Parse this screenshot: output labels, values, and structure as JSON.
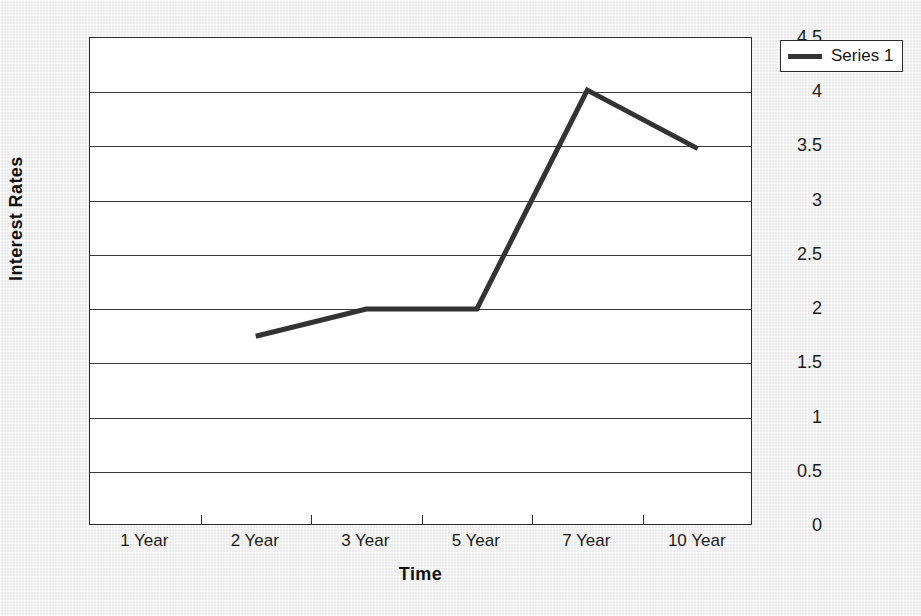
{
  "chart_data": {
    "type": "line",
    "title": "",
    "xlabel": "Time",
    "ylabel": "Interest Rates",
    "categories": [
      "1 Year",
      "2 Year",
      "3 Year",
      "5 Year",
      "7 Year",
      "10 Year"
    ],
    "series": [
      {
        "name": "Series 1",
        "values": [
          null,
          1.75,
          2.0,
          2.0,
          4.02,
          3.48
        ],
        "color": "#333333"
      }
    ],
    "ylim": [
      0,
      4.5
    ],
    "ytick_step": 0.5,
    "yticks": [
      "0",
      "0.5",
      "1",
      "1.5",
      "2",
      "2.5",
      "3",
      "3.5",
      "4",
      "4.5"
    ],
    "ytick_values": [
      0,
      0.5,
      1,
      1.5,
      2,
      2.5,
      3,
      3.5,
      4,
      4.5
    ],
    "grid": "horizontal",
    "legend_position": "top-right",
    "plot_background": "#ffffff",
    "figure_background": "#ececec",
    "axis_color": "#2b2b2b"
  },
  "legend": {
    "entries": [
      {
        "label": "Series 1"
      }
    ]
  },
  "axes": {
    "y_title": "Interest Rates",
    "x_title": "Time"
  }
}
